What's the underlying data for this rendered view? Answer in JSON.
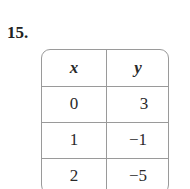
{
  "problem_number": "15.",
  "table": {
    "headers": [
      "x",
      "y"
    ],
    "rows": [
      [
        "0",
        "3"
      ],
      [
        "1",
        "−1"
      ],
      [
        "2",
        "−5"
      ]
    ]
  }
}
